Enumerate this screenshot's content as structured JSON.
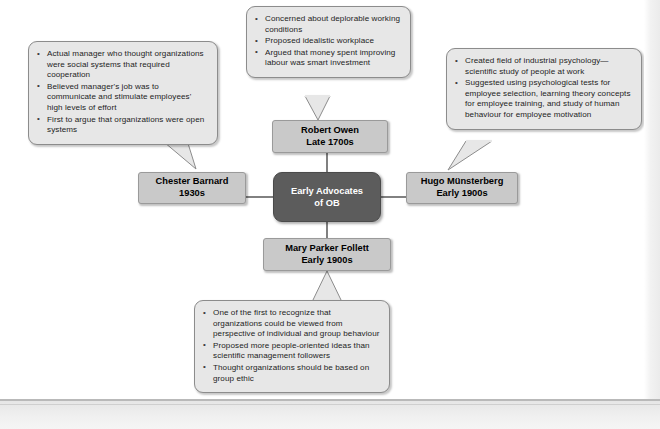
{
  "diagram": {
    "center": {
      "line1": "Early Advocates",
      "line2": "of OB"
    },
    "nodes": {
      "owen": {
        "name": "Robert Owen",
        "period": "Late 1700s"
      },
      "barnard": {
        "name": "Chester Barnard",
        "period": "1930s"
      },
      "munster": {
        "name": "Hugo Münsterberg",
        "period": "Early 1900s"
      },
      "follett": {
        "name": "Mary Parker Follett",
        "period": "Early 1900s"
      }
    },
    "callouts": {
      "owen": {
        "bullets": [
          "Concerned about deplorable working conditions",
          "Proposed idealistic workplace",
          "Argued that money spent improving labour was smart investment"
        ]
      },
      "barnard": {
        "bullets": [
          "Actual manager who thought organizations were social systems that required cooperation",
          "Believed manager's job was to communicate and stimulate employees' high levels of effort",
          "First to argue that organizations were open systems"
        ]
      },
      "munster": {
        "bullets": [
          "Created field of industrial psychology—scientific study of people at work",
          "Suggested using psychological tests for employee selection, learning theory concepts for employee training, and study of human behaviour for employee motivation"
        ]
      },
      "follett": {
        "bullets": [
          "One of the first to recognize that organizations could be  viewed from perspective of individual and group behaviour",
          "Proposed more people-oriented ideas than scientific management followers",
          "Thought organizations should be based on group ethic"
        ]
      }
    },
    "colors": {
      "center_fill": "#5c5c5c",
      "node_fill": "#c9c9c9",
      "callout_fill": "#e7e7e7",
      "border": "#8c8c8c",
      "connector": "#3d3d3d"
    }
  }
}
